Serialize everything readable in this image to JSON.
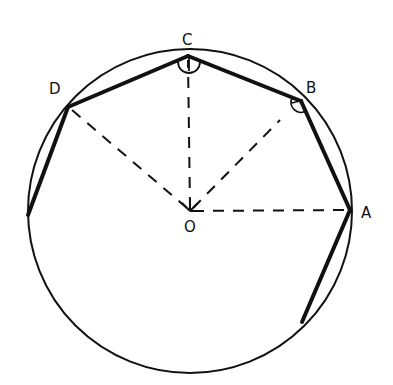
{
  "diagram": {
    "circle": {
      "cx": 190,
      "cy": 211,
      "r": 162
    },
    "center": {
      "label": "O",
      "x": 190,
      "y": 211,
      "label_x": 190,
      "label_y": 232
    },
    "vertices": [
      {
        "label": "A",
        "x": 350,
        "y": 210,
        "label_x": 366,
        "label_y": 218
      },
      {
        "label": "B",
        "x": 301,
        "y": 101,
        "label_x": 312,
        "label_y": 93
      },
      {
        "label": "C",
        "x": 188,
        "y": 56,
        "label_x": 188,
        "label_y": 45
      },
      {
        "label": "D",
        "x": 68,
        "y": 107,
        "label_x": 55,
        "label_y": 94
      }
    ],
    "extra_polygon_points": [
      {
        "x": 28,
        "y": 215
      },
      {
        "x": 302,
        "y": 322
      }
    ],
    "radii_dashed": [
      "OA",
      "OB",
      "OC",
      "OD"
    ],
    "angle_marks": [
      "C",
      "B"
    ],
    "colors": {
      "stroke": "#111111",
      "background": "#ffffff"
    }
  }
}
